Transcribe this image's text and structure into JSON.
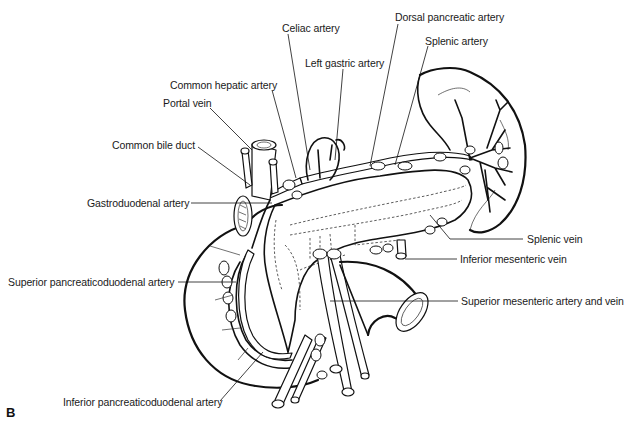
{
  "figure": {
    "panel_label": "B",
    "labels": [
      {
        "id": "celiac-artery",
        "text": "Celiac artery",
        "x": 282,
        "y": 22
      },
      {
        "id": "dorsal-pancreatic-artery",
        "text": "Dorsal pancreatic artery",
        "x": 395,
        "y": 11
      },
      {
        "id": "splenic-artery",
        "text": "Splenic artery",
        "x": 425,
        "y": 35
      },
      {
        "id": "left-gastric-artery",
        "text": "Left gastric artery",
        "x": 305,
        "y": 57
      },
      {
        "id": "common-hepatic-artery",
        "text": "Common hepatic artery",
        "x": 170,
        "y": 79
      },
      {
        "id": "portal-vein",
        "text": "Portal vein",
        "x": 163,
        "y": 97
      },
      {
        "id": "common-bile-duct",
        "text": "Common bile duct",
        "x": 112,
        "y": 139
      },
      {
        "id": "gastroduodenal-artery",
        "text": "Gastroduodenal artery",
        "x": 87,
        "y": 197
      },
      {
        "id": "splenic-vein",
        "text": "Splenic vein",
        "x": 527,
        "y": 233
      },
      {
        "id": "inferior-mesenteric-vein",
        "text": "Inferior mesenteric vein",
        "x": 460,
        "y": 253
      },
      {
        "id": "superior-pancreaticoduodenal-artery",
        "text": "Superior pancreaticoduodenal artery",
        "x": 8,
        "y": 276
      },
      {
        "id": "superior-mesenteric-artery-and-vein",
        "text": "Superior mesenteric artery and vein",
        "x": 461,
        "y": 295
      },
      {
        "id": "inferior-pancreaticoduodenal-artery",
        "text": "Inferior pancreaticoduodenal artery",
        "x": 63,
        "y": 396
      }
    ]
  }
}
